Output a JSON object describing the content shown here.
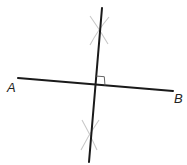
{
  "diagram": {
    "colors": {
      "line": "#1a1a1a",
      "arc": "#c8c8c8",
      "right_angle": "#555555",
      "label": "#222222",
      "background": "#ffffff"
    },
    "points": {
      "A": {
        "label": "A",
        "x": 18,
        "y": 78
      },
      "B": {
        "label": "B",
        "x": 173,
        "y": 91
      }
    },
    "segment_AB": {
      "x1": 18,
      "y1": 78,
      "x2": 173,
      "y2": 91
    },
    "perpendicular_bisector": {
      "x1": 102,
      "y1": 8,
      "x2": 89,
      "y2": 162
    },
    "intersection": {
      "x": 96,
      "y": 85
    },
    "right_angle_marker": {
      "size": 9
    },
    "construction_arcs": [
      {
        "position": "above",
        "cx": 99,
        "cy": 32
      },
      {
        "position": "below",
        "cx": 90,
        "cy": 135
      }
    ],
    "labels": [
      {
        "text": "A",
        "x": 7,
        "y": 92
      },
      {
        "text": "B",
        "x": 174,
        "y": 103
      }
    ]
  }
}
